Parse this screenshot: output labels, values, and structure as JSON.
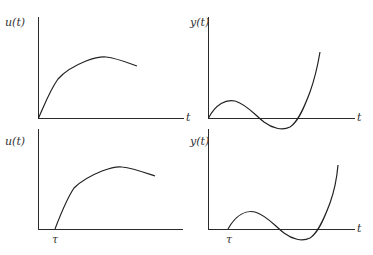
{
  "figure": {
    "panels": [
      {
        "id": "top-left",
        "y_label": "u(t)",
        "x_label": "t",
        "tick_label": "",
        "description": "Input u(t) starting at origin, rising concavely to a peak and then slowly decreasing"
      },
      {
        "id": "top-right",
        "y_label": "y(t)",
        "x_label": "t",
        "tick_label": "",
        "description": "Output y(t) starting at origin, small positive bump, dips below zero, then rises steeply"
      },
      {
        "id": "bottom-left",
        "y_label": "u(t)",
        "x_label": "t",
        "tick_label": "τ",
        "description": "Same input u(t) delayed by τ"
      },
      {
        "id": "bottom-right",
        "y_label": "y(t)",
        "x_label": "t",
        "tick_label": "τ",
        "description": "Same output y(t) delayed by τ"
      }
    ],
    "colors": {
      "line": "#222222",
      "axis": "#2a2a2a",
      "text": "#333333",
      "background": "#ffffff"
    }
  }
}
